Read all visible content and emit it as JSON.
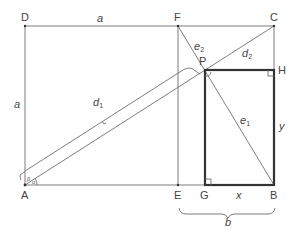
{
  "diagram": {
    "type": "geometry",
    "points": {
      "D": {
        "label": "D",
        "x": 25,
        "y": 26
      },
      "F": {
        "label": "F",
        "x": 178,
        "y": 26
      },
      "C": {
        "label": "C",
        "x": 274,
        "y": 26
      },
      "A": {
        "label": "A",
        "x": 25,
        "y": 185
      },
      "E": {
        "label": "E",
        "x": 178,
        "y": 185
      },
      "G": {
        "label": "G",
        "x": 205,
        "y": 185
      },
      "B": {
        "label": "B",
        "x": 274,
        "y": 185
      },
      "P": {
        "label": "P",
        "x": 205,
        "y": 70
      },
      "H": {
        "label": "H",
        "x": 274,
        "y": 70
      }
    },
    "segment_labels": {
      "a_top": "a",
      "a_left": "a",
      "d1_main": "d",
      "d1_sub": "1",
      "d2_main": "d",
      "d2_sub": "2",
      "e1_main": "e",
      "e1_sub": "1",
      "e2_main": "e",
      "e2_sub": "2",
      "x": "x",
      "y": "y",
      "b": "b"
    },
    "angle_labels": {
      "beta": "β",
      "alpha": "α"
    },
    "colors": {
      "thin_line": "#6e6e6e",
      "thick_line": "#333333",
      "text": "#444444",
      "background": "#ffffff"
    }
  }
}
